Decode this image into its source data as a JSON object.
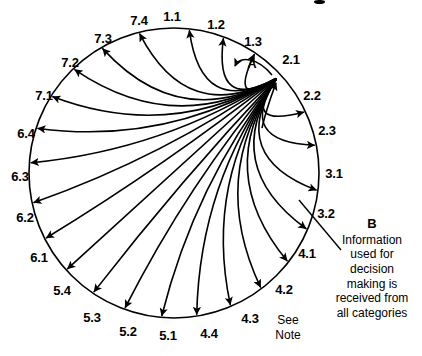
{
  "diagram": {
    "type": "radial-circle-flow",
    "title_visible": false,
    "geometry": {
      "center_x": 174,
      "center_y": 173,
      "radius": 145,
      "hub_x": 277,
      "hub_y": 78,
      "stroke_color": "#000000",
      "stroke_width": 1.6
    },
    "hub_node": "2.1",
    "nodes": [
      {
        "id": "1.1",
        "label": "1.1",
        "angle_deg": -84,
        "label_x": 172,
        "label_y": 16
      },
      {
        "id": "1.2",
        "label": "1.2",
        "angle_deg": -70,
        "label_x": 216,
        "label_y": 24
      },
      {
        "id": "1.3",
        "label": "1.3",
        "angle_deg": -56,
        "label_x": 253,
        "label_y": 41
      },
      {
        "id": "2.1",
        "label": "2.1",
        "angle_deg": -41,
        "label_x": 291,
        "label_y": 59
      },
      {
        "id": "2.2",
        "label": "2.2",
        "angle_deg": -25,
        "label_x": 312,
        "label_y": 95
      },
      {
        "id": "2.3",
        "label": "2.3",
        "angle_deg": -11,
        "label_x": 327,
        "label_y": 130
      },
      {
        "id": "3.1",
        "label": "3.1",
        "angle_deg": 7,
        "label_x": 334,
        "label_y": 173
      },
      {
        "id": "3.2",
        "label": "3.2",
        "angle_deg": 23,
        "label_x": 326,
        "label_y": 213
      },
      {
        "id": "4.1",
        "label": "4.1",
        "angle_deg": 38,
        "label_x": 307,
        "label_y": 253
      },
      {
        "id": "4.2",
        "label": "4.2",
        "angle_deg": 53,
        "label_x": 284,
        "label_y": 289
      },
      {
        "id": "4.3",
        "label": "4.3",
        "angle_deg": 67,
        "label_x": 250,
        "label_y": 318
      },
      {
        "id": "4.4",
        "label": "4.4",
        "angle_deg": 81,
        "label_x": 209,
        "label_y": 333
      },
      {
        "id": "5.1",
        "label": "5.1",
        "angle_deg": 95,
        "label_x": 168,
        "label_y": 335
      },
      {
        "id": "5.2",
        "label": "5.2",
        "angle_deg": 110,
        "label_x": 128,
        "label_y": 331
      },
      {
        "id": "5.3",
        "label": "5.3",
        "angle_deg": 124,
        "label_x": 92,
        "label_y": 317
      },
      {
        "id": "5.4",
        "label": "5.4",
        "angle_deg": 138,
        "label_x": 62,
        "label_y": 290
      },
      {
        "id": "6.1",
        "label": "6.1",
        "angle_deg": 153,
        "label_x": 39,
        "label_y": 257
      },
      {
        "id": "6.2",
        "label": "6.2",
        "angle_deg": 168,
        "label_x": 25,
        "label_y": 217
      },
      {
        "id": "6.3",
        "label": "6.3",
        "angle_deg": -176,
        "label_x": 20,
        "label_y": 176
      },
      {
        "id": "6.4",
        "label": "6.4",
        "angle_deg": -162,
        "label_x": 26,
        "label_y": 133
      },
      {
        "id": "7.1",
        "label": "7.1",
        "angle_deg": -148,
        "label_x": 44,
        "label_y": 95
      },
      {
        "id": "7.2",
        "label": "7.2",
        "angle_deg": -134,
        "label_x": 70,
        "label_y": 62
      },
      {
        "id": "7.3",
        "label": "7.3",
        "angle_deg": -120,
        "label_x": 103,
        "label_y": 38
      },
      {
        "id": "7.4",
        "label": "7.4",
        "angle_deg": -104,
        "label_x": 139,
        "label_y": 20
      }
    ],
    "markers": [
      {
        "id": "A",
        "label": "A",
        "x": 252,
        "y": 63,
        "meaning": "self-loop at hub"
      }
    ],
    "edges_note": "Curved arrows radiate from the hub node 2.1 outward to every category node; one arrow (B) points inward to the hub."
  },
  "callout": {
    "id": "B",
    "title": "B",
    "text": "Information used for decision making is received from all categories",
    "lines": [
      "Information",
      "used for",
      "decision",
      "making is",
      "received from",
      "all categories"
    ],
    "leader_line": {
      "x1": 299,
      "y1": 200,
      "x2": 341,
      "y2": 250
    }
  },
  "note": {
    "lines": [
      "See",
      "Note"
    ],
    "line1": "See",
    "line2": "Note"
  },
  "colors": {
    "stroke": "#000000",
    "background": "#ffffff",
    "text": "#000000"
  }
}
